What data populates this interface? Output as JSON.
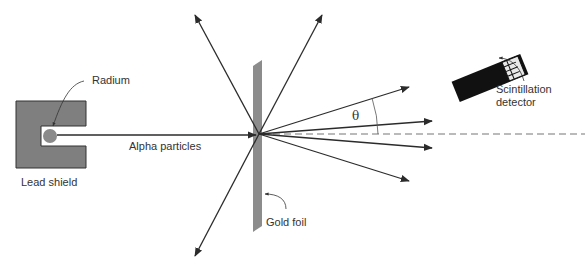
{
  "labels": {
    "radium": "Radium",
    "alpha_particles": "Alpha particles",
    "lead_shield": "Lead shield",
    "gold_foil": "Gold foil",
    "detector_line1": "Scintillation",
    "detector_line2": "detector",
    "angle": "θ"
  },
  "colors": {
    "shield": "#7f7f7f",
    "foil": "#8c8c8c",
    "radium": "#8a8a8a",
    "arrow": "#2b2b2b",
    "detector": "#111111",
    "text": "#333333"
  }
}
